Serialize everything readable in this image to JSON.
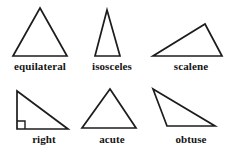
{
  "diagram": {
    "background_color": "#ffffff",
    "stroke_color": "#1c1c1c",
    "label_color": "#141414",
    "rows": 2,
    "columns": 3,
    "figures": [
      {
        "id": "equilateral",
        "label": "equilateral",
        "row": 1,
        "column": 1,
        "points": "40,8 67,56 13,56",
        "has_right_angle_mark": false
      },
      {
        "id": "isosceles",
        "label": "isosceles",
        "row": 1,
        "column": 2,
        "points": "107,10 120,56 95,56",
        "has_right_angle_mark": false
      },
      {
        "id": "scalene",
        "label": "scalene",
        "row": 1,
        "column": 3,
        "points": "205,24 222,56 153,56",
        "has_right_angle_mark": false
      },
      {
        "id": "right",
        "label": "right",
        "row": 2,
        "column": 1,
        "points": "17,91 68,129 17,129",
        "has_right_angle_mark": true,
        "right_angle_mark": "M 17,121 L 25,121 L 25,129"
      },
      {
        "id": "acute",
        "label": "acute",
        "row": 2,
        "column": 2,
        "points": "110,89 136,128 82,128",
        "has_right_angle_mark": false
      },
      {
        "id": "obtuse",
        "label": "obtuse",
        "row": 2,
        "column": 3,
        "points": "153,89 215,126 167,126",
        "has_right_angle_mark": false
      }
    ]
  }
}
